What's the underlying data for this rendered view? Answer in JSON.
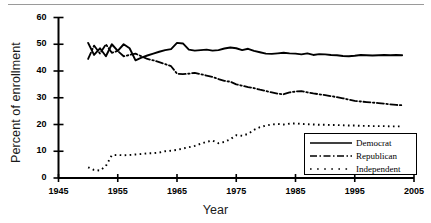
{
  "chart_data": {
    "type": "line",
    "title": "",
    "xlabel": "Year",
    "ylabel": "Percent of enrollment",
    "xlim": [
      1945,
      2005
    ],
    "ylim": [
      0,
      60
    ],
    "xticks": [
      1945,
      1955,
      1965,
      1975,
      1985,
      1995,
      2005
    ],
    "yticks": [
      0,
      10,
      20,
      30,
      40,
      50,
      60
    ],
    "grid": false,
    "legend_position": "lower-right",
    "x": [
      1950,
      1951,
      1952,
      1953,
      1954,
      1955,
      1956,
      1957,
      1958,
      1959,
      1960,
      1961,
      1962,
      1963,
      1964,
      1965,
      1966,
      1967,
      1968,
      1969,
      1970,
      1971,
      1972,
      1973,
      1974,
      1975,
      1976,
      1977,
      1978,
      1979,
      1980,
      1981,
      1982,
      1983,
      1984,
      1985,
      1986,
      1987,
      1988,
      1989,
      1990,
      1991,
      1992,
      1993,
      1994,
      1995,
      1996,
      1997,
      1998,
      1999,
      2000,
      2001,
      2002,
      2003
    ],
    "series": [
      {
        "name": "Democrat",
        "style": "solid",
        "values": [
          50.5,
          46.0,
          48.5,
          45.5,
          50.0,
          47.5,
          50.0,
          48.5,
          44.0,
          45.0,
          45.8,
          46.5,
          47.2,
          47.8,
          48.2,
          50.5,
          50.3,
          48.0,
          47.6,
          47.8,
          48.0,
          47.6,
          47.8,
          48.4,
          48.8,
          48.5,
          47.8,
          48.3,
          47.5,
          47.0,
          46.5,
          46.4,
          46.6,
          46.8,
          46.6,
          46.5,
          46.2,
          46.6,
          46.0,
          46.3,
          46.2,
          46.0,
          45.9,
          45.6,
          45.5,
          45.7,
          46.0,
          45.9,
          45.8,
          45.9,
          46.0,
          45.9,
          46.0,
          45.9
        ]
      },
      {
        "name": "Republican",
        "style": "dash-dot",
        "values": [
          44.5,
          49.5,
          46.5,
          50.0,
          46.8,
          47.5,
          45.5,
          46.0,
          46.5,
          45.5,
          44.5,
          44.0,
          43.3,
          42.6,
          41.8,
          39.0,
          38.8,
          39.0,
          39.3,
          38.8,
          38.3,
          37.8,
          37.0,
          36.3,
          36.0,
          35.0,
          34.5,
          34.0,
          33.6,
          33.0,
          32.5,
          32.0,
          31.5,
          31.3,
          32.0,
          32.3,
          32.5,
          32.0,
          31.6,
          31.3,
          31.0,
          30.6,
          30.2,
          29.8,
          29.3,
          28.8,
          28.6,
          28.4,
          28.2,
          28.0,
          27.8,
          27.5,
          27.3,
          27.2
        ]
      },
      {
        "name": "Independent",
        "style": "dotted",
        "values": [
          4.0,
          3.0,
          2.8,
          4.5,
          8.5,
          8.6,
          8.5,
          8.6,
          8.8,
          9.0,
          9.2,
          9.3,
          9.5,
          10.0,
          10.2,
          10.5,
          11.0,
          11.5,
          12.0,
          12.8,
          13.5,
          14.0,
          13.0,
          13.5,
          14.5,
          16.0,
          15.8,
          16.5,
          18.0,
          19.0,
          19.6,
          20.0,
          20.2,
          20.0,
          20.3,
          20.4,
          20.2,
          20.1,
          20.0,
          19.9,
          19.9,
          19.8,
          19.8,
          19.7,
          19.6,
          19.6,
          19.5,
          19.5,
          19.4,
          19.4,
          19.4,
          19.3,
          19.3,
          19.3
        ]
      }
    ]
  },
  "legend": {
    "entries": [
      {
        "label": "Democrat"
      },
      {
        "label": "Republican"
      },
      {
        "label": "Independent"
      }
    ]
  }
}
